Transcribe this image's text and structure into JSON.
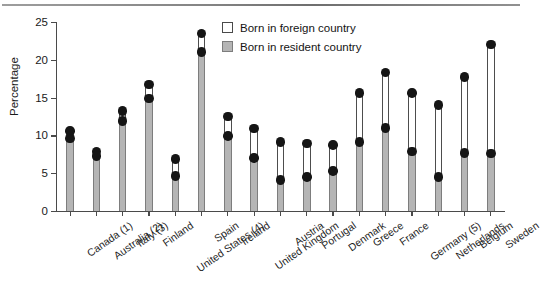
{
  "figure": {
    "caption_fragment": ""
  },
  "legend": {
    "position": "top-center",
    "items": [
      {
        "label": "Born in foreign country",
        "swatch": "white-square-icon",
        "color": "#ffffff"
      },
      {
        "label": "Born in resident country",
        "swatch": "gray-square-icon",
        "color": "#b5b5b5"
      }
    ]
  },
  "chart_data": {
    "type": "bar",
    "title": "",
    "subtitle": "",
    "xlabel": "",
    "ylabel": "Percentage",
    "ylim": [
      0,
      25
    ],
    "yticks": [
      0,
      5,
      10,
      15,
      20,
      25
    ],
    "grid": false,
    "marker": "filled-circle",
    "categories": [
      "Canada (1)",
      "Australia (2)",
      "Italy (3)",
      "Finland",
      "United States (4)",
      "Spain",
      "Ireland",
      "United Kingdom",
      "Austria",
      "Portugal",
      "Denmark",
      "Greece",
      "France",
      "Germany (5)",
      "Netherlands",
      "Belgium",
      "Sweden"
    ],
    "series": [
      {
        "name": "Born in foreign country",
        "values": [
          10.6,
          7.9,
          13.2,
          16.7,
          6.9,
          23.5,
          12.5,
          10.9,
          9.1,
          8.9,
          8.7,
          15.6,
          18.3,
          15.6,
          14.0,
          17.7,
          22.0
        ]
      },
      {
        "name": "Born in resident country",
        "values": [
          9.6,
          7.3,
          11.9,
          14.9,
          4.6,
          21.0,
          9.9,
          7.0,
          4.1,
          4.5,
          5.3,
          9.1,
          11.0,
          7.9,
          4.5,
          7.7,
          7.6
        ]
      }
    ]
  }
}
